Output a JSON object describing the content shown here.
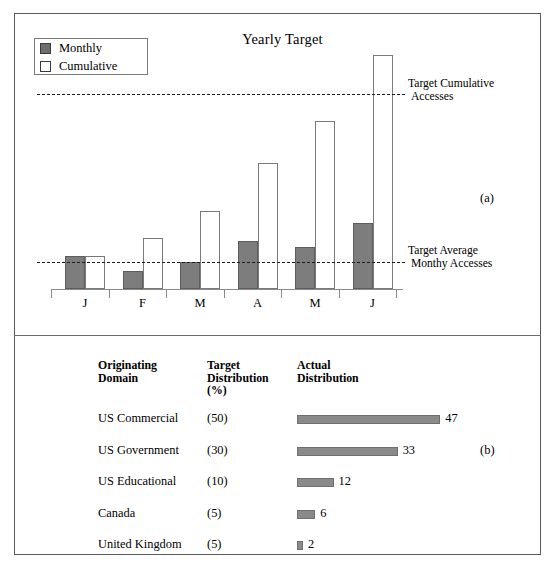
{
  "figure": {
    "panel_a_label": "(a)",
    "panel_b_label": "(b)"
  },
  "chart_data": [
    {
      "type": "bar",
      "title": "Yearly Target",
      "xlabel": "",
      "ylabel": "",
      "categories": [
        "J",
        "F",
        "M",
        "A",
        "M",
        "J"
      ],
      "series": [
        {
          "name": "Monthly",
          "values": [
            11,
            6,
            9,
            16,
            14,
            22
          ]
        },
        {
          "name": "Cumulative",
          "values": [
            11,
            17,
            26,
            42,
            56,
            78
          ]
        }
      ],
      "legend": {
        "position": "top-left",
        "entries": [
          {
            "label": "Monthly",
            "swatch": "filled-gray"
          },
          {
            "label": "Cumulative",
            "swatch": "open-white"
          }
        ]
      },
      "annotations": [
        {
          "name": "target-cumulative",
          "text_line1": "Target Cumulative",
          "text_line2": "Accesses",
          "value": 65,
          "style": "dashed"
        },
        {
          "name": "target-average",
          "text_line1": "Target Average",
          "text_line2": "Monthy Accesses",
          "value": 9,
          "style": "dashed"
        }
      ],
      "grid": false,
      "colors": {
        "monthly": "#7d7d7d",
        "cumulative": "#ffffff",
        "outline": "#5d5d5d",
        "dashed": "#1d1d1d"
      }
    },
    {
      "type": "bar",
      "orientation": "horizontal",
      "title": "",
      "headers": {
        "col1_line1": "Originating",
        "col1_line2": "Domain",
        "col2_line1": "Target",
        "col2_line2": "Distribution",
        "col2_line3": "(%)",
        "col3_line1": "Actual",
        "col3_line2": "Distribution"
      },
      "categories": [
        "US Commercial",
        "US Government",
        "US Educational",
        "Canada",
        "United Kingdom"
      ],
      "target_distribution": [
        "(50)",
        "(30)",
        "(10)",
        "(5)",
        "(5)"
      ],
      "values": [
        47,
        33,
        12,
        6,
        2
      ],
      "value_labels": [
        "47",
        "33",
        "12",
        "6",
        "2"
      ],
      "xlim": [
        0,
        52
      ],
      "grid": false,
      "colors": {
        "bar": "#8a8a8a",
        "outline": "#6f6f6f"
      }
    }
  ]
}
